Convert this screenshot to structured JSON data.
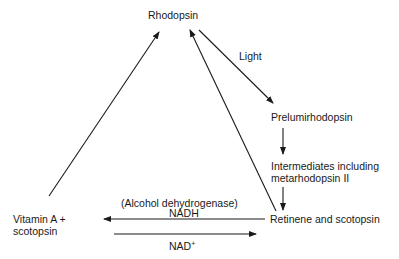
{
  "diagram": {
    "nodes": {
      "rhodopsin": "Rhodopsin",
      "prelumirhodopsin": "Prelumirhodopsin",
      "intermediates_line1": "Intermediates including",
      "intermediates_line2": "metarhodopsin II",
      "retinene": "Retinene and scotopsin",
      "vitamin_line1": "Vitamin A +",
      "vitamin_line2": "scotopsin"
    },
    "edge_labels": {
      "light": "Light",
      "enzyme": "(Alcohol dehydrogenase)",
      "nadh": "NADH",
      "nad": "NAD",
      "nad_sup": "+"
    },
    "edges": [
      {
        "from": "rhodopsin",
        "to": "prelumirhodopsin",
        "label": "Light"
      },
      {
        "from": "prelumirhodopsin",
        "to": "intermediates"
      },
      {
        "from": "intermediates",
        "to": "retinene"
      },
      {
        "from": "retinene",
        "to": "rhodopsin"
      },
      {
        "from": "retinene",
        "to": "vitamin_a",
        "label": "(Alcohol dehydrogenase) NADH"
      },
      {
        "from": "vitamin_a",
        "to": "retinene",
        "label": "NAD+"
      },
      {
        "from": "vitamin_a",
        "to": "rhodopsin"
      }
    ],
    "colors": {
      "ink": "#1a1a1a",
      "background": "#ffffff"
    }
  }
}
